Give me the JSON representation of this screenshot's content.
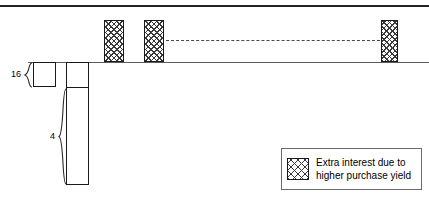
{
  "diagram": {
    "title": "",
    "colors": {
      "stroke": "#1a1a1a",
      "axis": "#5a5a5a",
      "hatch": "#3a3a3a",
      "dashed": "#4a4a4a",
      "legend_border": "#6a6a6a",
      "background": "#ffffff"
    },
    "rules": {
      "top_rule_name": "top-border-rule",
      "baseline_name": "horizontal-baseline"
    },
    "bars": [
      {
        "name": "extra-interest-bar-1",
        "fill": "crosshatch",
        "direction": "up"
      },
      {
        "name": "extra-interest-bar-2",
        "fill": "crosshatch",
        "direction": "up"
      },
      {
        "name": "extra-interest-bar-3",
        "fill": "crosshatch",
        "direction": "up"
      }
    ],
    "connector": {
      "name": "dashed-continuation-line",
      "style": "dashed"
    },
    "boxes": [
      {
        "name": "short-outline-box",
        "direction": "down"
      },
      {
        "name": "tall-outline-box",
        "direction": "down"
      }
    ],
    "dimensions": [
      {
        "label": "16",
        "name": "dimension-16"
      },
      {
        "label": "4",
        "name": "dimension-4"
      }
    ],
    "legend": {
      "swatch_pattern": "crosshatch",
      "lines": [
        "Extra interest due to",
        "higher purchase yield"
      ]
    }
  }
}
